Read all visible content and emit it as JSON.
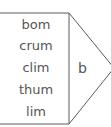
{
  "diagram": {
    "words": [
      "bom",
      "crum",
      "clim",
      "thum",
      "lim"
    ],
    "triangle_label": "b",
    "line_color": "#5a5a5a"
  }
}
